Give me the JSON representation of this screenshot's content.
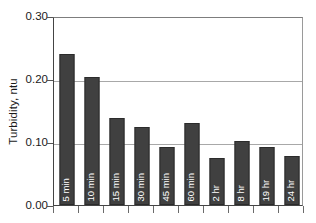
{
  "chart_data": {
    "type": "bar",
    "title": "",
    "subtitle": "",
    "xlabel": "",
    "ylabel": "Turbidity, ntu",
    "categories": [
      "5 min",
      "10 min",
      "15 min",
      "30 min",
      "45 min",
      "60 min",
      "2 hr",
      "8 hr",
      "19 hr",
      "24 hr"
    ],
    "values": [
      0.24,
      0.203,
      0.138,
      0.124,
      0.092,
      0.13,
      0.075,
      0.102,
      0.092,
      0.078
    ],
    "series": [
      {
        "name": "Turbidity",
        "values": [
          0.24,
          0.203,
          0.138,
          0.124,
          0.092,
          0.13,
          0.075,
          0.102,
          0.092,
          0.078
        ]
      }
    ],
    "ylim": [
      0.0,
      0.3
    ],
    "yticks": [
      0.0,
      0.1,
      0.2,
      0.3
    ],
    "ytick_labels": [
      "0.00",
      "0.10",
      "0.20",
      "0.30"
    ],
    "grid": true,
    "grid_axis": "y",
    "legend": false,
    "legend_position": "none",
    "bar_color": "#404040",
    "bar_label_color": "#ffffff",
    "axis_color": "#444444",
    "gridline_color": "#a8a8a8",
    "bar_labels_inside": true,
    "bar_label_rotation": 90,
    "annotations": []
  }
}
